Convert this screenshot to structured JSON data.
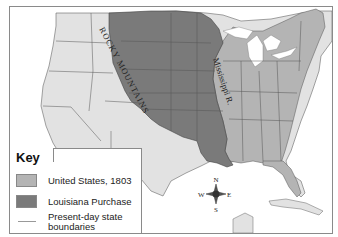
{
  "map": {
    "labels": {
      "rocky_mountains": "ROCKY MOUNTAINS",
      "mississippi": "Mississippi R."
    },
    "compass": {
      "n": "N",
      "s": "S",
      "e": "E",
      "w": "W"
    },
    "colors": {
      "us_1803": "#b4b4b4",
      "louisiana_purchase": "#7a7a7a",
      "other_land": "#e2e2e2",
      "water": "#ffffff",
      "state_boundary": "#555555"
    }
  },
  "key": {
    "title": "Key",
    "items": [
      {
        "label": "United States, 1803",
        "color": "#b4b4b4",
        "type": "fill"
      },
      {
        "label": "Louisiana Purchase",
        "color": "#7a7a7a",
        "type": "fill"
      },
      {
        "label_line1": "Present-day state",
        "label_line2": "boundaries",
        "color": "#999999",
        "type": "line"
      }
    ]
  }
}
